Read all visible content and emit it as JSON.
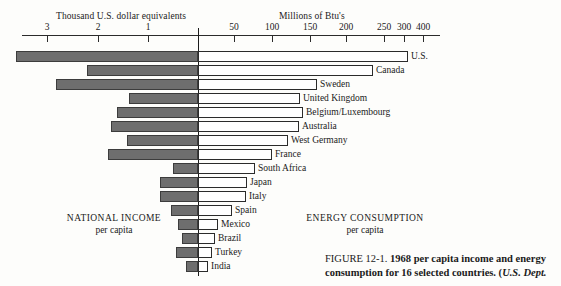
{
  "figure": {
    "number_label": "FIGURE 12-1.",
    "caption_bold": "1968 per capita income and energy consumption for 16 selected countries. (",
    "caption_source": "U.S. Dept."
  },
  "left_panel": {
    "axis_title": "Thousand U.S. dollar equivalents",
    "caption_main": "NATIONAL INCOME",
    "caption_sub": "per capita",
    "ticks": [
      {
        "label": "3",
        "x": 47
      },
      {
        "label": "2",
        "x": 98
      },
      {
        "label": "1",
        "x": 148
      }
    ]
  },
  "right_panel": {
    "axis_title": "Millions of Btu's",
    "caption_main": "ENERGY CONSUMPTION",
    "caption_sub": "per capita",
    "ticks": [
      {
        "label": "50",
        "x": 234
      },
      {
        "label": "100",
        "x": 272
      },
      {
        "label": "150",
        "x": 310
      },
      {
        "label": "200",
        "x": 346
      },
      {
        "label": "250",
        "x": 384
      },
      {
        "label": "300",
        "x": 404
      },
      {
        "label": "400",
        "x": 423
      }
    ]
  },
  "chart_data": {
    "type": "bar",
    "orientation": "horizontal-diverging",
    "title": "1968 per capita income and energy consumption for 16 selected countries.",
    "xlabel_left": "Thousand U.S. dollar equivalents",
    "xlabel_right": "Millions of Btu's",
    "left_series_name": "NATIONAL INCOME per capita",
    "right_series_name": "ENERGY CONSUMPTION per capita",
    "left_units": "thousand U.S. dollar equivalents",
    "right_units": "millions of Btu's",
    "left_axis_ticks": [
      3,
      2,
      1
    ],
    "right_axis_ticks": [
      50,
      100,
      150,
      200,
      250,
      300,
      400
    ],
    "grid": false,
    "legend": "none",
    "categories": [
      "U.S.",
      "Canada",
      "Sweden",
      "United Kingdom",
      "Belgium/Luxembourg",
      "Australia",
      "West Germany",
      "France",
      "South Africa",
      "Japan",
      "Italy",
      "Spain",
      "Mexico",
      "Brazil",
      "Turkey",
      "India"
    ],
    "series": [
      {
        "name": "National income per capita (thousand U.S. dollars)",
        "values": [
          3.65,
          2.23,
          2.85,
          1.39,
          1.63,
          1.75,
          1.43,
          1.81,
          0.51,
          1.17,
          0.78,
          0.55,
          0.41,
          0.33,
          0.45,
          0.25
        ]
      },
      {
        "name": "Energy consumption per capita (millions of Btu)",
        "values": [
          277,
          231,
          157,
          134,
          138,
          133,
          118,
          97,
          75,
          64,
          63,
          45,
          26,
          22,
          18,
          13
        ]
      }
    ],
    "rows": [
      {
        "country": "U.S.",
        "left_start_px": 16,
        "left_end_px": 198,
        "right_end_px": 408
      },
      {
        "country": "Canada",
        "left_start_px": 87,
        "left_end_px": 198,
        "right_end_px": 373
      },
      {
        "country": "Sweden",
        "left_start_px": 56,
        "left_end_px": 198,
        "right_end_px": 317
      },
      {
        "country": "United Kingdom",
        "left_start_px": 129,
        "left_end_px": 198,
        "right_end_px": 300
      },
      {
        "country": "Belgium/Luxembourg",
        "left_start_px": 117,
        "left_end_px": 198,
        "right_end_px": 303
      },
      {
        "country": "Australia",
        "left_start_px": 111,
        "left_end_px": 198,
        "right_end_px": 299
      },
      {
        "country": "West Germany",
        "left_start_px": 127,
        "left_end_px": 198,
        "right_end_px": 288
      },
      {
        "country": "France",
        "left_start_px": 108,
        "left_end_px": 198,
        "right_end_px": 272
      },
      {
        "country": "South Africa",
        "left_start_px": 173,
        "left_end_px": 198,
        "right_end_px": 255
      },
      {
        "country": "Japan",
        "left_start_px": 160,
        "left_end_px": 198,
        "right_end_px": 247
      },
      {
        "country": "Italy",
        "left_start_px": 160,
        "left_end_px": 198,
        "right_end_px": 246
      },
      {
        "country": "Spain",
        "left_start_px": 171,
        "left_end_px": 198,
        "right_end_px": 232
      },
      {
        "country": "Mexico",
        "left_start_px": 178,
        "left_end_px": 198,
        "right_end_px": 218
      },
      {
        "country": "Brazil",
        "left_start_px": 182,
        "left_end_px": 198,
        "right_end_px": 215
      },
      {
        "country": "Turkey",
        "left_start_px": 176,
        "left_end_px": 198,
        "right_end_px": 212
      },
      {
        "country": "India",
        "left_start_px": 186,
        "left_end_px": 198,
        "right_end_px": 208
      }
    ],
    "row_tops_px": [
      50,
      64,
      78,
      92,
      106,
      120,
      134,
      148,
      162,
      176,
      190,
      204,
      218,
      232,
      246,
      260
    ],
    "colors": {
      "left_bar_fill": "#6e6e6e",
      "left_bar_stroke": "#3c3c3c",
      "right_bar_fill": "#ffffff",
      "right_bar_stroke": "#2b2b2b",
      "axis": "#2b2b2b",
      "background": "#fdfdfb",
      "text": "#1a1a1a"
    }
  }
}
